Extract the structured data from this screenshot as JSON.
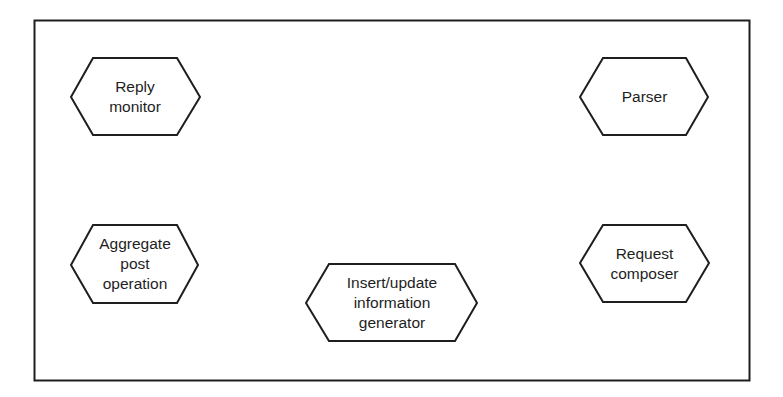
{
  "diagram": {
    "nodes": [
      {
        "id": "reply-monitor",
        "lines": [
          "Reply",
          "monitor"
        ]
      },
      {
        "id": "parser",
        "lines": [
          "Parser"
        ]
      },
      {
        "id": "aggregate-post-operation",
        "lines": [
          "Aggregate",
          "post",
          "operation"
        ]
      },
      {
        "id": "insert-update-information-generator",
        "lines": [
          "Insert/update",
          "information",
          "generator"
        ]
      },
      {
        "id": "request-composer",
        "lines": [
          "Request",
          "composer"
        ]
      }
    ],
    "colors": {
      "stroke": "#1e1e1e",
      "background": "#ffffff"
    }
  }
}
